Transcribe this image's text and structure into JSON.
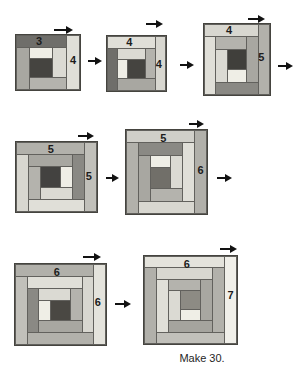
{
  "caption": "Make 30.",
  "palette": {
    "line": "#62615d",
    "border": "#45443f",
    "background": "#ffffff",
    "arrow": "#121212",
    "strips": {
      "C": "#4a4843",
      "s1": "#efeee6",
      "s2": "#dbdad3",
      "s3": "#b4b3ad",
      "s4": "#a8a7a1",
      "s5": "#8a8984",
      "s6": "#e0dfd8",
      "s7": "#d8d7d0",
      "s8": "#b2b1ab",
      "s9": "#c1c0ba",
      "s10": "#b1b0aa",
      "s11": "#e4e3dc",
      "s12": "#f0efe9"
    }
  },
  "blocks": [
    {
      "id": "step-1-block",
      "x": 15,
      "y": 34,
      "w": 66,
      "h": 57,
      "cols": 4,
      "rows": 4,
      "center_col": 1,
      "center_row": 2,
      "label_top": {
        "text": "3",
        "x_pct": 36,
        "y_pct": 10
      },
      "label_right": {
        "text": "4",
        "x_pct": 89,
        "y_pct": 46
      },
      "overrides": {
        "s5": "#6f6e6a",
        "C": "#454440"
      },
      "cells": [
        [
          "s5",
          0,
          0,
          3,
          1
        ],
        [
          "s6",
          3,
          0,
          1,
          4
        ],
        [
          "s4",
          0,
          1,
          1,
          3
        ],
        [
          "s1",
          1,
          1,
          1,
          1
        ],
        [
          "s2",
          2,
          1,
          1,
          2
        ],
        [
          "C",
          1,
          2,
          1,
          1
        ],
        [
          "s3",
          1,
          3,
          2,
          1
        ]
      ]
    },
    {
      "id": "step-2-block",
      "x": 106,
      "y": 35,
      "w": 61,
      "h": 57,
      "cols": 5,
      "rows": 4,
      "center_col": 2,
      "center_row": 2,
      "label_top": {
        "text": "4",
        "x_pct": 38,
        "y_pct": 11
      },
      "label_right": {
        "text": "4",
        "x_pct": 88,
        "y_pct": 51
      },
      "overrides": {
        "s5": "#6f6e6a",
        "C": "#454440"
      },
      "cells": [
        [
          "s6",
          0,
          0,
          4,
          1
        ],
        [
          "s7",
          4,
          0,
          1,
          4
        ],
        [
          "s5",
          0,
          1,
          1,
          3
        ],
        [
          "s2",
          1,
          1,
          2,
          1
        ],
        [
          "s3",
          3,
          1,
          1,
          2
        ],
        [
          "s1",
          1,
          2,
          1,
          1
        ],
        [
          "C",
          2,
          2,
          1,
          1
        ],
        [
          "s4",
          1,
          3,
          3,
          1
        ]
      ]
    },
    {
      "id": "step-3-block",
      "x": 203,
      "y": 23,
      "w": 68,
      "h": 73,
      "cols": 5,
      "rows": 5,
      "center_col": 2,
      "center_row": 2,
      "label_top": {
        "text": "4",
        "x_pct": 38,
        "y_pct": 9
      },
      "label_right": {
        "text": "5",
        "x_pct": 87,
        "y_pct": 47
      },
      "overrides": {
        "C": "#403f3b"
      },
      "cells": [
        [
          "s7",
          0,
          0,
          4,
          1
        ],
        [
          "s8",
          4,
          0,
          1,
          5
        ],
        [
          "s6",
          0,
          1,
          1,
          4
        ],
        [
          "s3",
          1,
          1,
          2,
          1
        ],
        [
          "s4",
          3,
          1,
          1,
          3
        ],
        [
          "s2",
          1,
          2,
          1,
          2
        ],
        [
          "C",
          2,
          2,
          1,
          1
        ],
        [
          "s1",
          2,
          3,
          1,
          1
        ],
        [
          "s5",
          1,
          4,
          3,
          1
        ]
      ]
    },
    {
      "id": "step-4-block",
      "x": 15,
      "y": 141,
      "w": 83,
      "h": 72,
      "cols": 6,
      "rows": 5,
      "center_col": 2,
      "center_row": 2,
      "label_top": {
        "text": "5",
        "x_pct": 43,
        "y_pct": 10
      },
      "label_right": {
        "text": "5",
        "x_pct": 90,
        "y_pct": 49
      },
      "overrides": {
        "C": "#434240"
      },
      "cells": [
        [
          "s8",
          0,
          0,
          5,
          1
        ],
        [
          "s9",
          5,
          0,
          1,
          5
        ],
        [
          "s7",
          0,
          1,
          1,
          4
        ],
        [
          "s4",
          1,
          1,
          3,
          1
        ],
        [
          "s5",
          4,
          1,
          1,
          3
        ],
        [
          "s3",
          1,
          2,
          1,
          2
        ],
        [
          "C",
          2,
          2,
          1,
          1
        ],
        [
          "s1",
          3,
          2,
          1,
          1
        ],
        [
          "s2",
          2,
          3,
          2,
          1
        ],
        [
          "s6",
          1,
          4,
          4,
          1
        ]
      ]
    },
    {
      "id": "step-5-block",
      "x": 125,
      "y": 129,
      "w": 83,
      "h": 86,
      "cols": 6,
      "rows": 6,
      "center_col": 2,
      "center_row": 3,
      "label_top": {
        "text": "5",
        "x_pct": 46,
        "y_pct": 9
      },
      "label_right": {
        "text": "6",
        "x_pct": 92,
        "y_pct": 48
      },
      "overrides": {
        "C": "#716f69",
        "s9": "#d0cfc9"
      },
      "cells": [
        [
          "s9",
          0,
          0,
          5,
          1
        ],
        [
          "s10",
          5,
          0,
          1,
          6
        ],
        [
          "s8",
          0,
          1,
          1,
          5
        ],
        [
          "s5",
          1,
          1,
          3,
          1
        ],
        [
          "s6",
          4,
          1,
          1,
          4
        ],
        [
          "s4",
          1,
          2,
          1,
          3
        ],
        [
          "s1",
          2,
          2,
          1,
          1
        ],
        [
          "s2",
          3,
          2,
          1,
          2
        ],
        [
          "C",
          2,
          3,
          1,
          1
        ],
        [
          "s3",
          2,
          4,
          2,
          1
        ],
        [
          "s7",
          1,
          5,
          4,
          1
        ]
      ]
    },
    {
      "id": "step-6-block",
      "x": 14,
      "y": 263,
      "w": 93,
      "h": 83,
      "cols": 7,
      "rows": 6,
      "center_col": 3,
      "center_row": 3,
      "label_top": {
        "text": "6",
        "x_pct": 46,
        "y_pct": 10
      },
      "label_right": {
        "text": "6",
        "x_pct": 91,
        "y_pct": 47
      },
      "overrides": {},
      "cells": [
        [
          "s10",
          0,
          0,
          6,
          1
        ],
        [
          "s11",
          6,
          0,
          1,
          6
        ],
        [
          "s9",
          0,
          1,
          1,
          5
        ],
        [
          "s6",
          1,
          1,
          4,
          1
        ],
        [
          "s7",
          5,
          1,
          1,
          4
        ],
        [
          "s5",
          1,
          2,
          1,
          3
        ],
        [
          "s2",
          2,
          2,
          2,
          1
        ],
        [
          "s3",
          4,
          2,
          1,
          2
        ],
        [
          "s1",
          2,
          3,
          1,
          1
        ],
        [
          "C",
          3,
          3,
          1,
          1
        ],
        [
          "s4",
          2,
          4,
          3,
          1
        ],
        [
          "s8",
          1,
          5,
          5,
          1
        ]
      ]
    },
    {
      "id": "step-7-block",
      "x": 143,
      "y": 255,
      "w": 95,
      "h": 90,
      "cols": 7,
      "rows": 7,
      "center_col": 3,
      "center_row": 3,
      "label_top": {
        "text": "6",
        "x_pct": 46,
        "y_pct": 9
      },
      "label_right": {
        "text": "7",
        "x_pct": 93,
        "y_pct": 44
      },
      "overrides": {
        "C": "#8d8b84",
        "s5": "#a5a49e"
      },
      "cells": [
        [
          "s11",
          0,
          0,
          6,
          1
        ],
        [
          "s12",
          6,
          0,
          1,
          7
        ],
        [
          "s10",
          0,
          1,
          1,
          6
        ],
        [
          "s7",
          1,
          1,
          4,
          1
        ],
        [
          "s8",
          5,
          1,
          1,
          5
        ],
        [
          "s6",
          1,
          2,
          1,
          4
        ],
        [
          "s3",
          2,
          2,
          2,
          1
        ],
        [
          "s4",
          4,
          2,
          1,
          3
        ],
        [
          "s2",
          2,
          3,
          1,
          2
        ],
        [
          "C",
          3,
          3,
          1,
          1
        ],
        [
          "s1",
          3,
          4,
          1,
          1
        ],
        [
          "s5",
          2,
          5,
          3,
          1
        ],
        [
          "s9",
          1,
          6,
          5,
          1
        ]
      ]
    }
  ],
  "arrows": [
    {
      "kind": "rotate",
      "x": 54,
      "y": 30,
      "len": 13
    },
    {
      "kind": "rotate",
      "x": 146,
      "y": 24,
      "len": 11
    },
    {
      "kind": "rotate",
      "x": 248,
      "y": 19,
      "len": 11
    },
    {
      "kind": "rotate",
      "x": 78,
      "y": 136,
      "len": 10
    },
    {
      "kind": "rotate",
      "x": 189,
      "y": 124,
      "len": 9
    },
    {
      "kind": "rotate",
      "x": 83,
      "y": 257,
      "len": 12
    },
    {
      "kind": "rotate",
      "x": 220,
      "y": 249,
      "len": 11
    },
    {
      "kind": "flow",
      "x": 88,
      "y": 61,
      "len": 8
    },
    {
      "kind": "flow",
      "x": 180,
      "y": 65,
      "len": 8
    },
    {
      "kind": "flow",
      "x": 278,
      "y": 66,
      "len": 9
    },
    {
      "kind": "flow",
      "x": 106,
      "y": 178,
      "len": 7
    },
    {
      "kind": "flow",
      "x": 217,
      "y": 178,
      "len": 9
    },
    {
      "kind": "flow",
      "x": 115,
      "y": 304,
      "len": 10
    }
  ]
}
